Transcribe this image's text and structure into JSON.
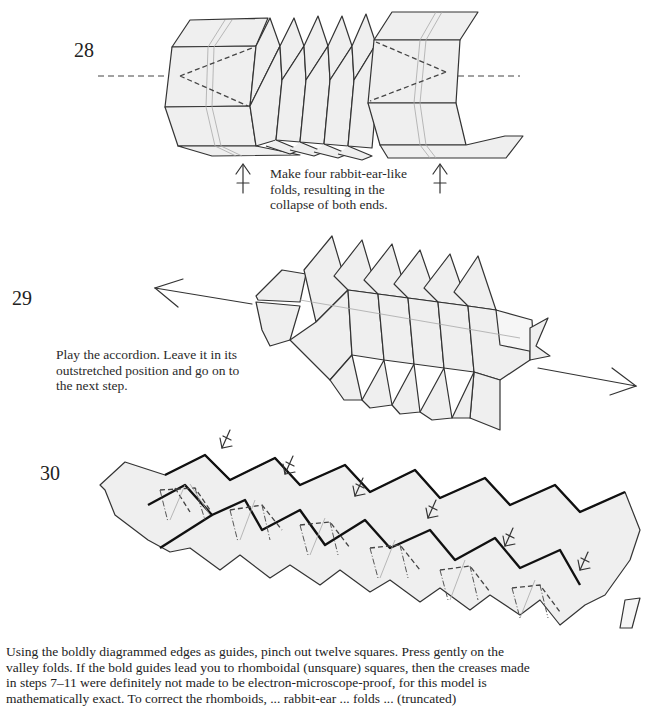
{
  "steps": [
    {
      "number": "28",
      "caption_lines": [
        "Make four rabbit-ear-like",
        "folds, resulting in the",
        "collapse of both ends."
      ],
      "symbols": [
        "valley-fold-line",
        "push-arrow-left",
        "push-arrow-right"
      ]
    },
    {
      "number": "29",
      "caption_lines": [
        "Play the accordion.  Leave it in its",
        "outstretched position and go on to",
        "the next step."
      ],
      "symbols": [
        "pull-arrow-left",
        "pull-arrow-right"
      ]
    },
    {
      "number": "30",
      "caption_lines": [
        "Using the boldly diagrammed edges as guides, pinch out twelve squares.  Press gently on the",
        "valley folds.  If the bold guides lead you to rhomboidal (unsquare) squares, then the creases made",
        "in steps 7–11 were definitely not made to be electron-microscope-proof, for this model is",
        "mathematically exact.  To correct the rhomboids, ... rabbit-ear ... folds ... (truncated)"
      ],
      "pinch_arrow_count": 6,
      "squares_count": 12
    }
  ],
  "colors": {
    "paper_fill": "#efefef",
    "line": "#333333",
    "bold_guide": "#111111",
    "text": "#222222",
    "background": "#ffffff"
  }
}
